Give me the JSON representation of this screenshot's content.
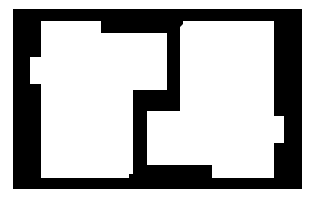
{
  "diagram": {
    "type": "floor-plan-silhouette",
    "background_color": "#ffffff",
    "wall_color": "#000000",
    "room_color": "#ffffff",
    "frame": {
      "x": 13,
      "y": 9,
      "width": 289,
      "height": 180
    },
    "rooms": [
      {
        "id": "room-left",
        "points": "41,21 101,21 101,33 167,33 167,90 133,90 133,174 129,174 129,178 41,178 41,84 30,84 30,57 41,57"
      },
      {
        "id": "room-right-top",
        "points": "183,21 274,21 274,116 284,116 284,143 274,143 274,178 212,178 212,165 147,165 147,111 180,111 180,27 183,24"
      }
    ]
  }
}
